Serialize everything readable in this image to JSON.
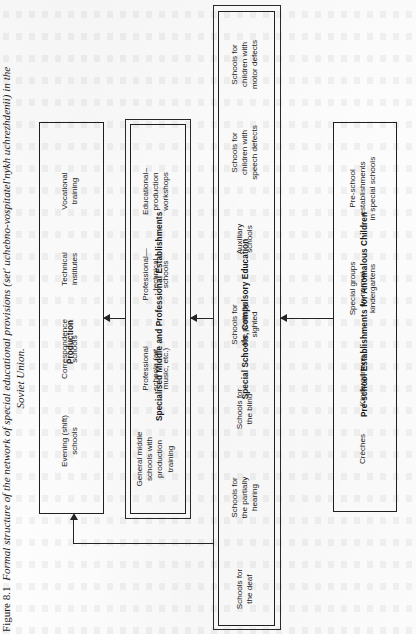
{
  "figure": {
    "label": "Figure 8.1",
    "title_line1": "Formal structure of the network of special educational provisions (set' uchebno-vospitatel'nykh uchrezhdenii) in the",
    "title_line2": "Soviet Union."
  },
  "groups": {
    "production": {
      "title": "Production",
      "items": [
        "Evening (shift)\nschools",
        "Correspondence\nschools",
        "Technical\ninstitutes",
        "Vocational\ntraining"
      ]
    },
    "specialised_middle": {
      "title": "Specialised Middle and Professional Establishments",
      "items": [
        "General middle\nschools with\nproduction\ntraining",
        "Professional\nschools (art,\nmusic, etc.)",
        "Professional—\ntechnical\nschools",
        "Educational–\nproduction\nworkshops"
      ]
    },
    "special_schools": {
      "title": "Special Schools, Compulsory Education",
      "items": [
        "Schools for\nthe deaf",
        "Schools for\nthe partially\nhearing",
        "Schools for\nthe blind",
        "Schools for\nthe partially\nsighted",
        "Auxiliary\nschools",
        "Schools for\nchildren with\nspeech defects",
        "Schools for\nchildren with\nmotor defects"
      ]
    },
    "pre_school": {
      "title": "Pre-school Establishments for Anomalous Children",
      "items": [
        "Crèches",
        "Kindergartens",
        "Special groups\nin normal\nkindergartens",
        "Pre-school\nestablishments\nin special schools"
      ]
    }
  },
  "flow": {
    "arrows": [
      {
        "from": "specialised_middle",
        "to": "production",
        "direction": "left"
      },
      {
        "from": "special_schools",
        "to": "specialised_middle",
        "direction": "left"
      },
      {
        "from": "pre_school",
        "to": "special_schools",
        "direction": "left"
      },
      {
        "from": "special_schools",
        "to": "production",
        "direction": "up-elbow"
      }
    ]
  },
  "colors": {
    "ink": "#1f1f1f",
    "paper": "#fdfdfd"
  }
}
